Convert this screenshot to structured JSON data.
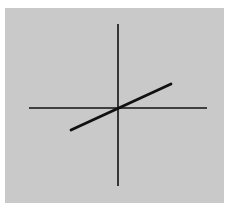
{
  "diagram": {
    "type": "coordinate-axes-with-line",
    "panel": {
      "x": 5,
      "y": 8,
      "width": 219,
      "height": 195,
      "color": "#c9c9c9"
    },
    "axes": {
      "color": "#111111",
      "horizontal": {
        "x1": 29,
        "y1": 108,
        "x2": 207,
        "y2": 108,
        "width": 1.6
      },
      "vertical": {
        "x1": 118,
        "y1": 24,
        "x2": 118,
        "y2": 186,
        "width": 1.6
      }
    },
    "line": {
      "color": "#111111",
      "x1": 71,
      "y1": 130,
      "x2": 171,
      "y2": 84,
      "width": 2.8
    },
    "origin": {
      "x": 118,
      "y": 108
    }
  }
}
